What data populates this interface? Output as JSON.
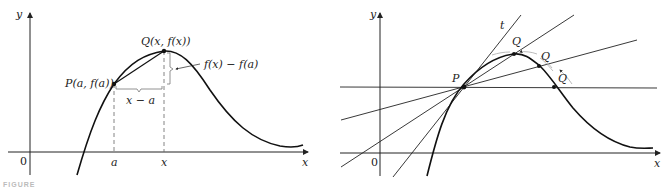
{
  "figure_left": {
    "title": "Secant line PQ",
    "axis_x_label": "x",
    "axis_y_label": "y",
    "origin_label": "0",
    "point_p_label": "P(a, f(a))",
    "point_q_label": "Q(x, f(x))",
    "rise_label": "f(x) − f(a)",
    "run_label": "x − a",
    "tick_a_label": "a",
    "tick_x_label": "x"
  },
  "figure_right": {
    "title": "Secant lines approaching tangent",
    "axis_x_label": "x",
    "axis_y_label": "y",
    "origin_label": "0",
    "point_p_label": "P",
    "q_labels": [
      "Q",
      "Q",
      "Q"
    ],
    "tangent_label": "t"
  },
  "caption": "FIGURE"
}
